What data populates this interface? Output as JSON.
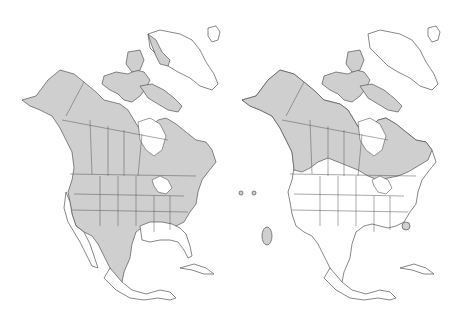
{
  "figure": {
    "type": "range-maps",
    "region": "North America",
    "panels": [
      {
        "id": "left",
        "description": "Range map with shading over Alaska, Canada, Arctic islands, most of the contiguous US (excluding the southeast Gulf states and California/Pacific coast) and northern Mexico",
        "shaded_regions": [
          "Alaska",
          "Canada",
          "Arctic Archipelago",
          "Western and Central US",
          "Northeastern US",
          "Northern Mexico"
        ]
      },
      {
        "id": "right",
        "description": "Range map with shading over Alaska, Canada, Arctic islands, small areas in northern US border states, and isolated patches in Arizona/New Mexico, Idaho/Wyoming and the Carolinas",
        "shaded_regions": [
          "Alaska",
          "Canada",
          "Arctic Archipelago",
          "Northern border of US",
          "Isolated patch Arizona",
          "Isolated patch South Carolina",
          "Isolated patches Idaho/Wyoming"
        ]
      }
    ],
    "colors": {
      "range_fill": "#cfcfcf",
      "land_fill": "#ffffff",
      "outline": "#555555",
      "background": "#ffffff"
    }
  }
}
